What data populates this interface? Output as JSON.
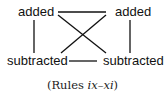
{
  "diagram": {
    "nodes": {
      "top_left": "added",
      "top_right": "added",
      "bottom_left": "subtracted",
      "bottom_right": "subtracted"
    },
    "edges": [
      {
        "from": "top_left",
        "to": "top_right"
      },
      {
        "from": "top_left",
        "to": "bottom_left"
      },
      {
        "from": "top_right",
        "to": "bottom_right"
      },
      {
        "from": "top_left",
        "to": "bottom_right"
      },
      {
        "from": "top_right",
        "to": "bottom_left"
      },
      {
        "from": "bottom_left",
        "to": "bottom_right"
      }
    ],
    "line_color": "#111111"
  },
  "caption": {
    "open": "(Rules ",
    "range": "ix–xi",
    "close": ")"
  }
}
